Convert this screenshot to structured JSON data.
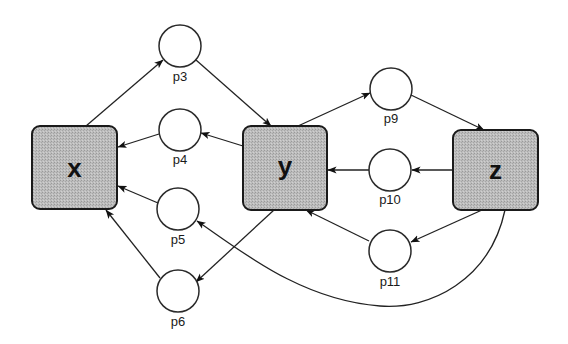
{
  "diagram": {
    "type": "petri-net",
    "transitions": [
      {
        "id": "x",
        "label": "x",
        "x": 32,
        "y": 126,
        "w": 85,
        "h": 83
      },
      {
        "id": "y",
        "label": "y",
        "x": 243,
        "y": 126,
        "w": 84,
        "h": 84
      },
      {
        "id": "z",
        "label": "z",
        "x": 453,
        "y": 130,
        "w": 85,
        "h": 80
      }
    ],
    "places": [
      {
        "id": "p3",
        "label": "p3",
        "cx": 180,
        "cy": 46,
        "r": 21
      },
      {
        "id": "p4",
        "label": "p4",
        "cx": 180,
        "cy": 130,
        "r": 21
      },
      {
        "id": "p5",
        "label": "p5",
        "cx": 178,
        "cy": 209,
        "r": 21
      },
      {
        "id": "p6",
        "label": "p6",
        "cx": 178,
        "cy": 291,
        "r": 21
      },
      {
        "id": "p9",
        "label": "p9",
        "cx": 391,
        "cy": 89,
        "r": 21
      },
      {
        "id": "p10",
        "label": "p10",
        "cx": 390,
        "cy": 170,
        "r": 21
      },
      {
        "id": "p11",
        "label": "p11",
        "cx": 390,
        "cy": 251,
        "r": 21
      }
    ],
    "arcs": [
      {
        "from": "x",
        "to": "p3"
      },
      {
        "from": "p3",
        "to": "y"
      },
      {
        "from": "y",
        "to": "p4"
      },
      {
        "from": "p4",
        "to": "x"
      },
      {
        "from": "p5",
        "to": "x"
      },
      {
        "from": "p6",
        "to": "x"
      },
      {
        "from": "y",
        "to": "p6"
      },
      {
        "from": "y",
        "to": "p9"
      },
      {
        "from": "p9",
        "to": "z"
      },
      {
        "from": "z",
        "to": "p10"
      },
      {
        "from": "p10",
        "to": "y"
      },
      {
        "from": "z",
        "to": "p11"
      },
      {
        "from": "p11",
        "to": "y"
      },
      {
        "from": "z",
        "to": "p5",
        "curved": true
      }
    ],
    "colors": {
      "transition_fill": "#b8b8b8",
      "stroke": "#222222",
      "place_fill": "#ffffff"
    }
  }
}
